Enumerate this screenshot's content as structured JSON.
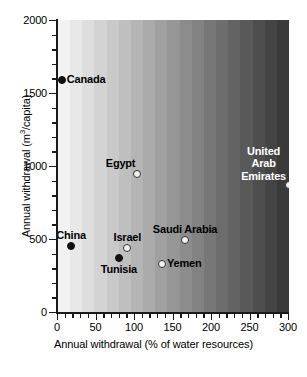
{
  "chart_data": {
    "type": "scatter",
    "title": "",
    "xlabel": "Annual  withdrawal  (% of water resources)",
    "ylabel": "Annual  withdrawal  (m3/capita)",
    "ylabel_prefix": "Annual  withdrawal  (m",
    "ylabel_exponent": "3",
    "ylabel_suffix": "/capita)",
    "xlim": [
      0,
      300
    ],
    "ylim": [
      0,
      2000
    ],
    "x_major_ticks": [
      0,
      50,
      100,
      150,
      200,
      250,
      300
    ],
    "x_minor_interval": 10,
    "y_major_ticks": [
      0,
      500,
      1000,
      1500,
      2000
    ],
    "y_minor_interval": 100,
    "grid": false,
    "legend": "none",
    "background": "horizontal grayscale gradient, light at left to dark at right, in discrete vertical bands",
    "background_bands": 19,
    "background_light": "#f2f2f2",
    "background_dark": "#3a3a3a",
    "marker_filled_color": "#111111",
    "marker_open_fill": "#f2f2f2",
    "marker_open_edge": "#333333",
    "points": [
      {
        "name": "Canada",
        "x": 5,
        "y": 1590,
        "marker": "filled",
        "label_color": "dark",
        "label_pos": "right"
      },
      {
        "name": "Egypt",
        "x": 103,
        "y": 945,
        "marker": "open",
        "label_color": "dark",
        "label_pos": "left-above"
      },
      {
        "name": "United Arab Emirates",
        "x": 300,
        "y": 870,
        "marker": "open",
        "label_color": "light",
        "label_pos": "left-above"
      },
      {
        "name": "China",
        "x": 17,
        "y": 455,
        "marker": "filled",
        "label_color": "dark",
        "label_pos": "above"
      },
      {
        "name": "Israel",
        "x": 90,
        "y": 440,
        "marker": "open",
        "label_color": "dark",
        "label_pos": "above"
      },
      {
        "name": "Tunisia",
        "x": 79,
        "y": 370,
        "marker": "filled",
        "label_color": "dark",
        "label_pos": "below"
      },
      {
        "name": "Saudi Arabia",
        "x": 165,
        "y": 490,
        "marker": "open",
        "label_color": "dark",
        "label_pos": "above"
      },
      {
        "name": "Yemen",
        "x": 135,
        "y": 330,
        "marker": "open",
        "label_color": "dark",
        "label_pos": "right"
      }
    ],
    "labels": {
      "canada": "Canada",
      "egypt": "Egypt",
      "uae_line1": "United",
      "uae_line2": "Arab",
      "uae_line3": "Emirates",
      "china": "China",
      "israel": "Israel",
      "tunisia": "Tunisia",
      "saudi_arabia": "Saudi Arabia",
      "yemen": "Yemen"
    },
    "axis_tick_text": {
      "y": [
        "2000",
        "1500",
        "1000",
        "500",
        "0"
      ],
      "x": [
        "0",
        "50",
        "100",
        "150",
        "200",
        "250",
        "300"
      ]
    }
  }
}
